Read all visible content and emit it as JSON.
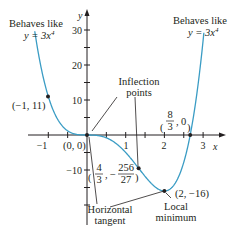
{
  "chart_data": {
    "type": "line",
    "function": "y = 3x^4 - 8x^3",
    "xlabel": "x",
    "ylabel": "y",
    "xlim": [
      -1.6,
      3.6
    ],
    "ylim": [
      -22,
      37
    ],
    "x_ticks": [
      -1,
      1,
      2,
      3
    ],
    "x_tick_labels": [
      "−1",
      "1",
      "2",
      "3"
    ],
    "y_ticks": [
      -10,
      10,
      20,
      30
    ],
    "y_tick_labels": [
      "−10",
      "10",
      "20",
      "30"
    ],
    "grid": false,
    "curve_color": "#3a9cc4",
    "points": [
      {
        "x": -1,
        "y": 11,
        "label": "(−1, 11)"
      },
      {
        "x": 0,
        "y": 0,
        "label": "(0, 0)"
      },
      {
        "x": 1.3333,
        "y": -9.4815,
        "label_num_x": "4",
        "label_den_x": "3",
        "label_num_y": "256",
        "label_den_y": "27"
      },
      {
        "x": 2,
        "y": -16,
        "label": "(2, −16)"
      },
      {
        "x": 2.6667,
        "y": 0,
        "label_num_x": "8",
        "label_den_x": "3",
        "label_y": "0"
      }
    ],
    "annotations": {
      "left_behaves": "Behaves like",
      "left_eq": "y = 3x",
      "right_behaves": "Behaves like",
      "right_eq": "y = 3x",
      "exponent": "4",
      "inflection_line1": "Inflection",
      "inflection_line2": "points",
      "horizontal_line1": "Horizontal",
      "horizontal_line2": "tangent",
      "local_line1": "Local",
      "local_line2": "minimum"
    }
  }
}
